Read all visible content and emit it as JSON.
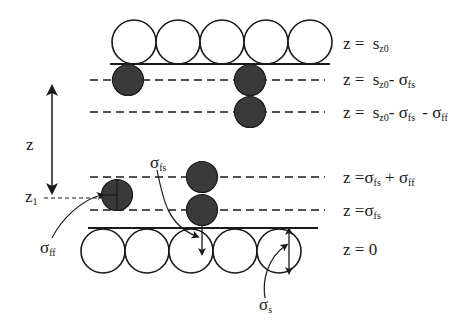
{
  "diagram": {
    "type": "adsorption-layer-schematic",
    "colors": {
      "background": "#ffffff",
      "line": "#1a1a1a",
      "solid_particle_fill": "#ffffff",
      "fluid_particle_fill": "#3a3a3a"
    },
    "levels": [
      {
        "id": "top-wall",
        "style": "solid",
        "equation": {
          "lhs": "z =",
          "main": "s",
          "sub": "z0",
          "rest": ""
        }
      },
      {
        "id": "level-1",
        "style": "dashed",
        "equation": {
          "lhs": "z =",
          "main": "s",
          "sub": "z0",
          "rest": "- σ",
          "rest_sub": "fs"
        }
      },
      {
        "id": "level-2",
        "style": "dashed",
        "equation": {
          "lhs": "z =",
          "main": "s",
          "sub": "z0",
          "rest": "- σ",
          "rest_sub": "fs",
          "rest2": " - σ",
          "rest2_sub": "ff"
        }
      },
      {
        "id": "level-3",
        "style": "dashed",
        "equation": {
          "lhs": "z =",
          "main": "σ",
          "sub": "fs",
          "rest": " +  σ",
          "rest_sub": "ff"
        }
      },
      {
        "id": "level-4",
        "style": "dashed",
        "equation": {
          "lhs": "z =",
          "main": "σ",
          "sub": "fs"
        }
      },
      {
        "id": "bottom-wall",
        "style": "solid",
        "equation": {
          "lhs": "z = 0"
        }
      }
    ],
    "labels": {
      "z_axis": "z",
      "z1": {
        "main": "z",
        "sub": "1"
      },
      "sigma_fs": {
        "main": "σ",
        "sub": "fs"
      },
      "sigma_ff": {
        "main": "σ",
        "sub": "ff"
      },
      "sigma_s": {
        "main": "σ",
        "sub": "s"
      }
    },
    "top_wall_particles": 5,
    "bottom_wall_particles": 5,
    "fluid_particles": 6
  }
}
